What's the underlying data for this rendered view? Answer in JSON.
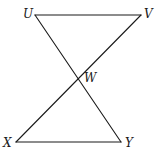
{
  "figure": {
    "type": "geometry-diagram",
    "points": {
      "U": {
        "label": "U",
        "x": 35,
        "y": 15,
        "label_x": 23,
        "label_y": 18
      },
      "V": {
        "label": "V",
        "x": 141,
        "y": 15,
        "label_x": 144,
        "label_y": 18
      },
      "W": {
        "label": "W",
        "x": 78,
        "y": 79,
        "label_x": 84,
        "label_y": 81
      },
      "X": {
        "label": "X",
        "x": 16,
        "y": 142,
        "label_x": 3,
        "label_y": 147
      },
      "Y": {
        "label": "Y",
        "x": 121,
        "y": 142,
        "label_x": 125,
        "label_y": 147
      }
    },
    "segments": [
      {
        "name": "UV",
        "from": "U",
        "to": "V"
      },
      {
        "name": "XY",
        "from": "X",
        "to": "Y"
      },
      {
        "name": "UY",
        "from": "U",
        "to": "Y"
      },
      {
        "name": "VX",
        "from": "V",
        "to": "X"
      }
    ],
    "line_color": "#1a1a1a"
  }
}
